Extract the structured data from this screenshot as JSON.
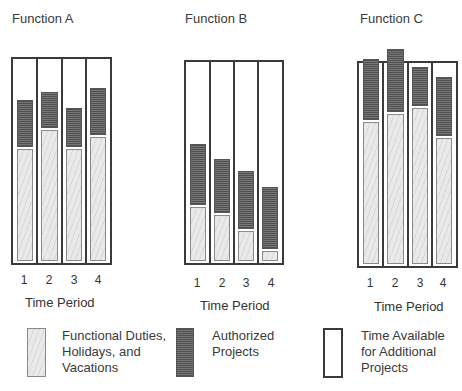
{
  "chart_data": [
    {
      "type": "bar",
      "stacked": true,
      "title": "Function A",
      "xlabel": "Time Period",
      "ylabel": "",
      "categories": [
        "1",
        "2",
        "3",
        "4"
      ],
      "series": [
        {
          "name": "Functional Duties, Holidays, and Vacations",
          "values": [
            56,
            65,
            56,
            62
          ]
        },
        {
          "name": "Authorized Projects",
          "values": [
            24,
            19,
            20,
            24
          ]
        }
      ],
      "capacity": 100,
      "ylim": [
        0,
        100
      ],
      "grid": false,
      "legend_position": "bottom"
    },
    {
      "type": "bar",
      "stacked": true,
      "title": "Function B",
      "xlabel": "Time Period",
      "ylabel": "",
      "categories": [
        "1",
        "2",
        "3",
        "4"
      ],
      "series": [
        {
          "name": "Functional Duties, Holidays, and Vacations",
          "values": [
            28,
            24,
            16,
            6
          ]
        },
        {
          "name": "Authorized Projects",
          "values": [
            31,
            28,
            30,
            32
          ]
        }
      ],
      "capacity": 100,
      "ylim": [
        0,
        100
      ],
      "grid": false,
      "legend_position": "bottom"
    },
    {
      "type": "bar",
      "stacked": true,
      "title": "Function C",
      "xlabel": "Time Period",
      "ylabel": "",
      "categories": [
        "1",
        "2",
        "3",
        "4"
      ],
      "series": [
        {
          "name": "Functional Duties, Holidays, and Vacations",
          "values": [
            71,
            75,
            78,
            63
          ]
        },
        {
          "name": "Authorized Projects",
          "values": [
            31,
            32,
            20,
            30
          ]
        }
      ],
      "capacity": 100,
      "ylim": [
        0,
        100
      ],
      "grid": false,
      "legend_position": "bottom",
      "annotation": "Periods 1 and 2 exceed available capacity"
    }
  ],
  "panels": [
    {
      "title": "Function A",
      "xlabel": "Time Period",
      "ticks": [
        "1",
        "2",
        "3",
        "4"
      ]
    },
    {
      "title": "Function B",
      "xlabel": "Time Period",
      "ticks": [
        "1",
        "2",
        "3",
        "4"
      ]
    },
    {
      "title": "Function C",
      "xlabel": "Time Period",
      "ticks": [
        "1",
        "2",
        "3",
        "4"
      ]
    }
  ],
  "legend": [
    {
      "key": "functional",
      "lines": [
        "Functional Duties,",
        "Holidays, and",
        "Vacations"
      ]
    },
    {
      "key": "authorized",
      "lines": [
        "Authorized",
        "Projects"
      ]
    },
    {
      "key": "available",
      "lines": [
        "Time Available",
        "for Additional",
        "Projects"
      ]
    }
  ],
  "colors": {
    "functional_fill": "#e9e9e9",
    "authorized_fill": "#6b6b6b",
    "outline": "#3a3a3a"
  }
}
